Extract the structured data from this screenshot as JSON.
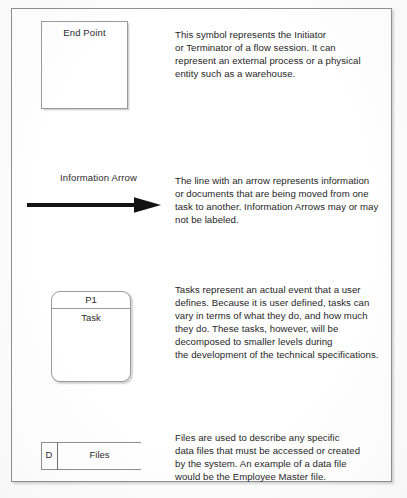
{
  "document": {
    "type": "flowchart-symbol-legend",
    "frame_border_color": "#8e8e8e",
    "text_color": "#262626",
    "background_color": "#ffffff"
  },
  "rows": {
    "endpoint": {
      "symbol_name": "End Point",
      "symbol_label": "End Point",
      "description": "This symbol represents the Initiator\nor Terminator of a flow session. It can\nrepresent an external process or a physical\nentity such as a warehouse."
    },
    "arrow": {
      "symbol_name": "Information Arrow",
      "symbol_label": "Information Arrow",
      "description": "The line with an arrow represents information\nor documents that are being moved from one\ntask to another. Information Arrows may or may\nnot be labeled."
    },
    "task": {
      "symbol_name": "Task",
      "process_id": "P1",
      "symbol_label": "Task",
      "description": "Tasks represent an actual event that a user\ndefines. Because it is user defined, tasks can\nvary in terms of what they do, and how much\nthey do. These tasks, however, will be\ndecomposed to smaller levels during\nthe development of the technical specifications."
    },
    "files": {
      "symbol_name": "Files",
      "store_code": "D",
      "symbol_label": "Files",
      "description": "Files are used to describe any specific\ndata files that must be accessed or created\nby the system. An example of a data file\nwould be the Employee Master file."
    }
  }
}
